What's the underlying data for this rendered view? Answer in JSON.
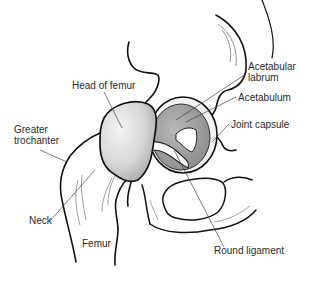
{
  "diagram": {
    "labels": [
      {
        "id": "head_of_femur",
        "text": "Head of femur"
      },
      {
        "id": "greater_trochanter",
        "text": "Greater\ntrochanter"
      },
      {
        "id": "neck",
        "text": "Neck"
      },
      {
        "id": "femur",
        "text": "Femur"
      },
      {
        "id": "acetabular_labrum",
        "text": "Acetabular\nlabrum"
      },
      {
        "id": "acetabulum",
        "text": "Acetabulum"
      },
      {
        "id": "joint_capsule",
        "text": "Joint capsule"
      },
      {
        "id": "round_ligament",
        "text": "Round ligament"
      }
    ],
    "colors": {
      "outline": "#111111",
      "leader_line": "#444444",
      "femoral_head_fill": "#d9d9d9",
      "acetabulum_fill": "#9a9a9a",
      "background": "#ffffff"
    }
  }
}
